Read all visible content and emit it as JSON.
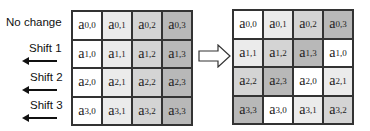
{
  "row_labels": [
    "No change",
    "Shift 1",
    "Shift 2",
    "Shift 3"
  ],
  "shade_colors": {
    "w": "#ffffff",
    "l": "#ebebeb",
    "m": "#d4d4d4",
    "d": "#b8b8b8"
  },
  "left_grid": [
    [
      {
        "t": "a",
        "s": "0,0",
        "c": "w"
      },
      {
        "t": "a",
        "s": "0,1",
        "c": "l"
      },
      {
        "t": "a",
        "s": "0,2",
        "c": "m"
      },
      {
        "t": "a",
        "s": "0,3",
        "c": "d"
      }
    ],
    [
      {
        "t": "a",
        "s": "1,0",
        "c": "w"
      },
      {
        "t": "a",
        "s": "1,1",
        "c": "l"
      },
      {
        "t": "a",
        "s": "1,2",
        "c": "m"
      },
      {
        "t": "a",
        "s": "1,3",
        "c": "d"
      }
    ],
    [
      {
        "t": "a",
        "s": "2,0",
        "c": "w"
      },
      {
        "t": "a",
        "s": "2,1",
        "c": "l"
      },
      {
        "t": "a",
        "s": "2,2",
        "c": "m"
      },
      {
        "t": "a",
        "s": "2,3",
        "c": "d"
      }
    ],
    [
      {
        "t": "a",
        "s": "3,0",
        "c": "w"
      },
      {
        "t": "a",
        "s": "3,1",
        "c": "l"
      },
      {
        "t": "a",
        "s": "3,2",
        "c": "m"
      },
      {
        "t": "a",
        "s": "3,3",
        "c": "d"
      }
    ]
  ],
  "right_grid": [
    [
      {
        "t": "a",
        "s": "0,0",
        "c": "w"
      },
      {
        "t": "a",
        "s": "0,1",
        "c": "l"
      },
      {
        "t": "a",
        "s": "0,2",
        "c": "m"
      },
      {
        "t": "a",
        "s": "0,3",
        "c": "d"
      }
    ],
    [
      {
        "t": "a",
        "s": "1,1",
        "c": "l"
      },
      {
        "t": "a",
        "s": "1,2",
        "c": "m"
      },
      {
        "t": "a",
        "s": "1,3",
        "c": "d"
      },
      {
        "t": "a",
        "s": "1,0",
        "c": "w"
      }
    ],
    [
      {
        "t": "a",
        "s": "2,2",
        "c": "m"
      },
      {
        "t": "a",
        "s": "2,3",
        "c": "d"
      },
      {
        "t": "a",
        "s": "2,0",
        "c": "w"
      },
      {
        "t": "a",
        "s": "2,1",
        "c": "l"
      }
    ],
    [
      {
        "t": "a",
        "s": "3,3",
        "c": "d"
      },
      {
        "t": "a",
        "s": "3,0",
        "c": "w"
      },
      {
        "t": "a",
        "s": "3,1",
        "c": "l"
      },
      {
        "t": "a",
        "s": "3,2",
        "c": "m"
      }
    ]
  ]
}
